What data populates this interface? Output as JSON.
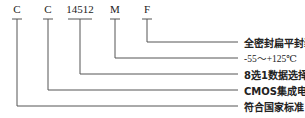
{
  "diagram": {
    "codes": [
      {
        "text": "C",
        "x": 17
      },
      {
        "text": "C",
        "x": 48
      },
      {
        "text": "14512",
        "x": 80
      },
      {
        "text": "M",
        "x": 115
      },
      {
        "text": "F",
        "x": 147
      }
    ],
    "labels": [
      {
        "text": "全密封扁平封装",
        "y": 42,
        "from_code": 4
      },
      {
        "text": "-55～+125℃",
        "y": 58,
        "from_code": 3
      },
      {
        "text": "8选1数据选择器",
        "y": 74,
        "from_code": 2
      },
      {
        "text": "CMOS集成电路",
        "y": 90,
        "from_code": 1
      },
      {
        "text": "符合国家标准",
        "y": 106,
        "from_code": 0
      }
    ],
    "line_end_x": 238,
    "line_color": "#555555"
  }
}
